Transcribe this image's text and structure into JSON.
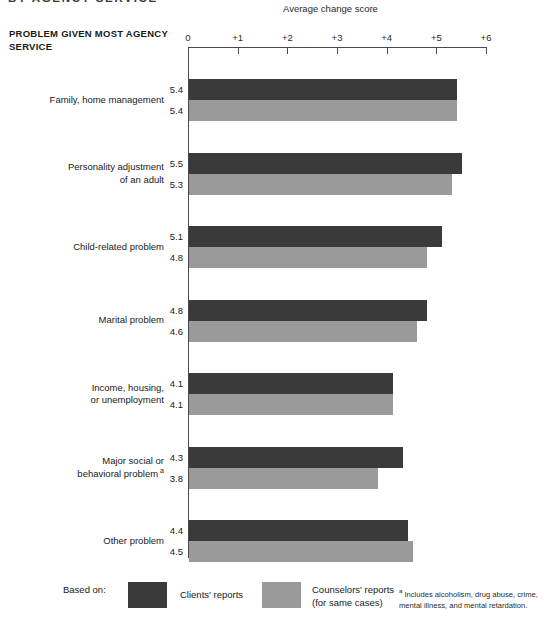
{
  "top_title_partial": "BY AGENCY SERVICE",
  "axis_title": "Average change score",
  "column_header": "PROBLEM GIVEN MOST AGENCY SERVICE",
  "legend": {
    "based_on_label": "Based on:",
    "clients_label": "Clients' reports",
    "counselors_label": "Counselors' reports\n(for same cases)",
    "clients_color": "#3a3a3a",
    "counselors_color": "#9a9a9a"
  },
  "footnote": {
    "marker": "a",
    "text": "Includes alcoholism, drug abuse, crime, mental illness, and mental retardation."
  },
  "chart_data": {
    "type": "bar",
    "orientation": "horizontal",
    "title": "Average change score",
    "xlabel": "Average change score",
    "ylabel": "PROBLEM GIVEN MOST AGENCY SERVICE",
    "xlim": [
      0,
      6
    ],
    "xticks": [
      0,
      1,
      2,
      3,
      4,
      5,
      6
    ],
    "xtick_labels": [
      "0",
      "+1",
      "+2",
      "+3",
      "+4",
      "+5",
      "+6"
    ],
    "grid": false,
    "legend_position": "bottom",
    "categories": [
      "Family, home management",
      "Personality adjustment\nof an adult",
      "Child-related problem",
      "Marital problem",
      "Income, housing,\nor unemployment",
      "Major social or\nbehavioral problem",
      "Other problem"
    ],
    "category_footnote_index": 5,
    "series": [
      {
        "name": "Clients' reports",
        "color": "#3a3a3a",
        "values": [
          5.4,
          5.5,
          5.1,
          4.8,
          4.1,
          4.3,
          4.4
        ],
        "labels": [
          "5.4",
          "5.5",
          "5.1",
          "4.8",
          "4.1",
          "4.3",
          "4.4"
        ]
      },
      {
        "name": "Counselors' reports (for same cases)",
        "color": "#9a9a9a",
        "values": [
          5.4,
          5.3,
          4.8,
          4.6,
          4.1,
          3.8,
          4.5
        ],
        "labels": [
          "5.4",
          "5.3",
          "4.8",
          "4.6",
          "4.1",
          "3.8",
          "4.5"
        ]
      }
    ]
  }
}
